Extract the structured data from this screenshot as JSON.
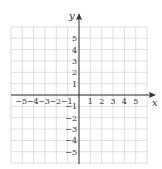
{
  "chart_data": {
    "type": "scatter",
    "title": "",
    "xlabel": "x",
    "ylabel": "y",
    "xlim": [
      -6,
      6
    ],
    "ylim": [
      -6,
      6
    ],
    "grid": true,
    "x_ticks": [
      -5,
      -4,
      -3,
      -2,
      -1,
      1,
      2,
      3,
      4,
      5
    ],
    "y_ticks": [
      5,
      4,
      3,
      2,
      1,
      -1,
      -2,
      -3,
      -4,
      -5
    ],
    "x_tick_labels": [
      "−5",
      "−4",
      "−3",
      "−2",
      "−1",
      "1",
      "2",
      "3",
      "4",
      "5"
    ],
    "y_tick_labels": [
      "5",
      "4",
      "3",
      "2",
      "1",
      "−1",
      "−2",
      "−3",
      "−4",
      "−5"
    ],
    "points": []
  },
  "labels": {
    "x_axis": "x",
    "y_axis": "y"
  },
  "colors": {
    "grid": "#d6d6d6",
    "axis": "#333333"
  }
}
